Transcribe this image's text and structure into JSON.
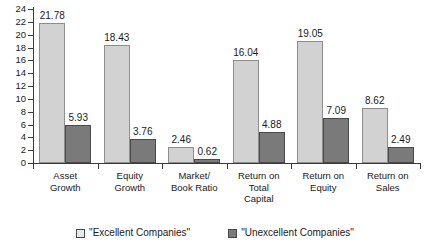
{
  "chart_data": {
    "type": "bar",
    "title": "",
    "xlabel": "",
    "ylabel": "",
    "ylim": [
      0,
      24
    ],
    "ytick_step": 2,
    "yticks": [
      0,
      2,
      4,
      6,
      8,
      10,
      12,
      14,
      16,
      18,
      20,
      22,
      24
    ],
    "grid": false,
    "legend_position": "bottom-center",
    "categories": [
      "Asset Growth",
      "Equity Growth",
      "Market/ Book Ratio",
      "Return on Total Capital",
      "Return on Equity",
      "Return on Sales"
    ],
    "category_lines": [
      [
        "Asset",
        "Growth"
      ],
      [
        "Equity",
        "Growth"
      ],
      [
        "Market/",
        "Book Ratio"
      ],
      [
        "Return on",
        "Total",
        "Capital"
      ],
      [
        "Return on",
        "Equity"
      ],
      [
        "Return on",
        "Sales"
      ]
    ],
    "series": [
      {
        "name": "\"Excellent Companies\"",
        "color": "#d2d2d2",
        "values": [
          21.78,
          18.43,
          2.46,
          16.04,
          19.05,
          8.62
        ],
        "labels": [
          "21.78",
          "18.43",
          "2.46",
          "16.04",
          "19.05",
          "8.62"
        ]
      },
      {
        "name": "\"Unexcellent Companies\"",
        "color": "#7a7a7a",
        "values": [
          5.93,
          3.76,
          0.62,
          4.88,
          7.09,
          2.49
        ],
        "labels": [
          "5.93",
          "3.76",
          "0.62",
          "4.88",
          "7.09",
          "2.49"
        ]
      }
    ]
  },
  "legend": {
    "items": [
      {
        "label": "\"Excellent Companies\"",
        "swatch": "light"
      },
      {
        "label": "\"Unexcellent Companies\"",
        "swatch": "dark"
      }
    ]
  },
  "colors": {
    "series_light": "#d2d2d2",
    "series_dark": "#7a7a7a",
    "axis": "#3a3a3a",
    "text": "#1a1a1a",
    "background": "#ffffff"
  }
}
